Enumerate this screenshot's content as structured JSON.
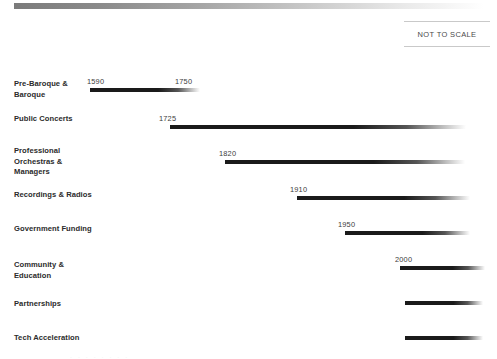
{
  "header": {
    "top_rule_name": "gradient-divider",
    "scale_note": "NOT TO SCALE"
  },
  "colors": {
    "bar_dark": "#1a1a1a",
    "bar_fade": "#ffffff",
    "rule_start": "#7b7b7b",
    "rule_end": "#ffffff",
    "label_text": "#2b2b2b",
    "year_text": "#3d3d3d",
    "note_border": "#c9c9c9"
  },
  "chart_data": {
    "type": "bar",
    "title": "",
    "xlabel": "",
    "ylabel": "",
    "grid": false,
    "legend": "none",
    "annotations": [
      "NOT TO SCALE"
    ],
    "categories": [
      "Pre-Baroque & Baroque",
      "Public Concerts",
      "Professional Orchestras & Managers",
      "Recordings & Radios",
      "Government Funding",
      "Community & Education",
      "Partnerships",
      "Tech Acceleration"
    ],
    "start_years": [
      1590,
      1725,
      1820,
      1910,
      1950,
      2000,
      null,
      null
    ],
    "end_years": [
      1750,
      null,
      null,
      null,
      null,
      null,
      null,
      null
    ],
    "rows": [
      {
        "label": "Pre-Baroque & Baroque",
        "start_label": "1590",
        "end_label": "1750",
        "bar_left": 90,
        "bar_width": 110,
        "top": 79,
        "bar_top": 88,
        "label_x": 14,
        "start_x": 87,
        "end_x": 175
      },
      {
        "label": "Public Concerts",
        "start_label": "1725",
        "end_label": "",
        "bar_left": 170,
        "bar_width": 296,
        "top": 114,
        "bar_top": 125,
        "label_x": 14,
        "start_x": 159,
        "end_x": 0
      },
      {
        "label": "Professional Orchestras & Managers",
        "start_label": "1820",
        "end_label": "",
        "bar_left": 225,
        "bar_width": 240,
        "top": 146,
        "bar_top": 160,
        "label_x": 14,
        "start_x": 219,
        "end_x": 0
      },
      {
        "label": "Recordings & Radios",
        "start_label": "1910",
        "end_label": "",
        "bar_left": 297,
        "bar_width": 173,
        "top": 190,
        "bar_top": 196,
        "label_x": 14,
        "start_x": 290,
        "end_x": 0
      },
      {
        "label": "Government Funding",
        "start_label": "1950",
        "end_label": "",
        "bar_left": 345,
        "bar_width": 125,
        "top": 224,
        "bar_top": 231,
        "label_x": 14,
        "start_x": 338,
        "end_x": 0
      },
      {
        "label": "Community & Education",
        "start_label": "2000",
        "end_label": "",
        "bar_left": 400,
        "bar_width": 85,
        "top": 260,
        "bar_top": 266,
        "label_x": 14,
        "start_x": 395,
        "end_x": 0
      },
      {
        "label": "Partnerships",
        "start_label": "",
        "end_label": "",
        "bar_left": 405,
        "bar_width": 78,
        "top": 299,
        "bar_top": 301,
        "label_x": 14,
        "start_x": 0,
        "end_x": 0
      },
      {
        "label": "Tech Acceleration",
        "start_label": "",
        "end_label": "",
        "bar_left": 405,
        "bar_width": 78,
        "top": 333,
        "bar_top": 336,
        "label_x": 14,
        "start_x": 0,
        "end_x": 0
      }
    ]
  }
}
